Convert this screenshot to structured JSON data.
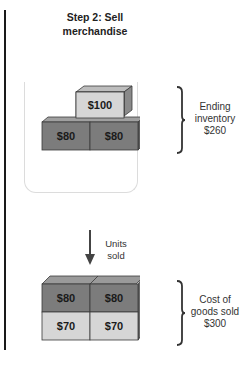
{
  "title": "Step 2: Sell merchandise",
  "colors": {
    "box_dark": "#7c7c7c",
    "box_medium": "#a9a9a9",
    "box_light": "#d6d6d6",
    "outline": "#3a3a3a"
  },
  "ending_inventory": {
    "boxes": [
      {
        "label": "$100",
        "shade": "light"
      },
      {
        "label": "$80",
        "shade": "dark"
      },
      {
        "label": "$80",
        "shade": "dark"
      }
    ],
    "label_line1": "Ending",
    "label_line2": "inventory",
    "label_line3": "$260"
  },
  "arrow": {
    "label_line1": "Units",
    "label_line2": "sold"
  },
  "cost_of_goods_sold": {
    "boxes": [
      {
        "label": "$80",
        "shade": "dark"
      },
      {
        "label": "$80",
        "shade": "dark"
      },
      {
        "label": "$70",
        "shade": "light"
      },
      {
        "label": "$70",
        "shade": "light"
      }
    ],
    "label_line1": "Cost of",
    "label_line2": "goods sold",
    "label_line3": "$300"
  }
}
